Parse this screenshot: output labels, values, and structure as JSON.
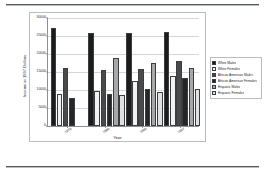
{
  "figure": {
    "y_axis_title": "Income in 1997 Dollars",
    "x_axis_title": "Year"
  },
  "legend": {
    "items": [
      {
        "label": "White Males",
        "color": "#1c1c1c"
      },
      {
        "label": "White Females",
        "color": "#f2f2f2"
      },
      {
        "label": "African American Males",
        "color": "#4a4a4a"
      },
      {
        "label": "African American Females",
        "color": "#262626"
      },
      {
        "label": "Hispanic Males",
        "color": "#a8a8a8"
      },
      {
        "label": "Hispanic Females",
        "color": "#e0e0e0"
      }
    ]
  },
  "axis": {
    "y_ticks": [
      "30000",
      "25000",
      "20000",
      "15000",
      "10000",
      "5000",
      "0"
    ],
    "y_tick_values": [
      30000,
      25000,
      20000,
      15000,
      10000,
      5000,
      0
    ]
  },
  "chart_data": {
    "type": "bar",
    "title": "",
    "xlabel": "Year",
    "ylabel": "Income in 1997 Dollars",
    "ylim": [
      0,
      30000
    ],
    "grid": true,
    "legend_position": "right",
    "categories": [
      "1970",
      "1980",
      "1990",
      "1997"
    ],
    "series": [
      {
        "name": "White Males",
        "color": "#1c1c1c",
        "values": [
          27200,
          25900,
          25900,
          26100
        ]
      },
      {
        "name": "White Females",
        "color": "#f2f2f2",
        "values": [
          8900,
          9600,
          12600,
          13900
        ]
      },
      {
        "name": "African American Males",
        "color": "#4a4a4a",
        "values": [
          16100,
          15600,
          15800,
          18100
        ]
      },
      {
        "name": "African American Females",
        "color": "#262626",
        "values": [
          7900,
          8900,
          10200,
          13200
        ]
      },
      {
        "name": "Hispanic Males",
        "color": "#a8a8a8",
        "values": [
          null,
          18800,
          17400,
          16100
        ]
      },
      {
        "name": "Hispanic Females",
        "color": "#e0e0e0",
        "values": [
          null,
          8500,
          9400,
          10200
        ]
      }
    ]
  }
}
